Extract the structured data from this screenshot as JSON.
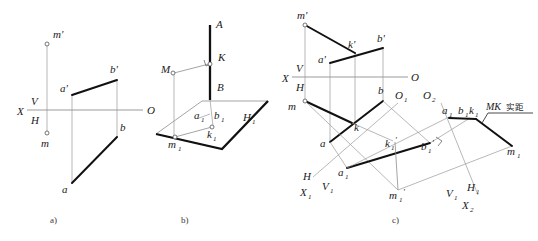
{
  "figure": {
    "width": 538,
    "height": 241,
    "background": "#ffffff",
    "line_color_thick": "#111111",
    "line_color_thin": "#9a9a9a",
    "subfigure_captions": [
      "a)",
      "b)",
      "c)"
    ]
  },
  "panel_a": {
    "caption": "a)",
    "axis_labels": {
      "x": "X",
      "v": "V",
      "h": "H",
      "o": "O"
    },
    "points": [
      {
        "id": "m-prime",
        "label": "m'",
        "x": 47,
        "y": 42
      },
      {
        "id": "a-prime",
        "label": "a'",
        "x": 72,
        "y": 95
      },
      {
        "id": "b-prime",
        "label": "b'",
        "x": 117,
        "y": 80
      },
      {
        "id": "b",
        "label": "b",
        "x": 117,
        "y": 137
      },
      {
        "id": "m",
        "label": "m",
        "x": 47,
        "y": 138
      },
      {
        "id": "a",
        "label": "a",
        "x": 72,
        "y": 183
      }
    ]
  },
  "panel_b": {
    "caption": "b)",
    "labels": {
      "line_top": "A",
      "line_bottom": "B",
      "point_k": "K",
      "point_m": "M",
      "plane": "H1",
      "a1": "a1",
      "b1": "b1",
      "k1": "k1",
      "m1": "m1"
    },
    "points": [
      {
        "id": "K",
        "label": "K",
        "x": 210,
        "y": 63
      },
      {
        "id": "M",
        "label": "M",
        "x": 172,
        "y": 73
      },
      {
        "id": "k1",
        "label": "k1",
        "x": 213,
        "y": 126
      },
      {
        "id": "m1",
        "label": "m1",
        "x": 174,
        "y": 138
      }
    ],
    "right_angle_at": "K"
  },
  "panel_c": {
    "caption": "c)",
    "axis_labels": {
      "x": "X",
      "v": "V",
      "h": "H",
      "o": "O",
      "o1": "O1",
      "o2": "O2",
      "x1": "X1",
      "v1_left": "V1",
      "h_left": "H",
      "x2": "X2",
      "v1_right": "V1",
      "h1_right": "H1"
    },
    "annotation": {
      "text": "MK实距",
      "latin": "MK",
      "cjk": "实距"
    },
    "points": [
      {
        "id": "m-prime",
        "label": "m'",
        "x": 305,
        "y": 22
      },
      {
        "id": "a-prime",
        "label": "a'",
        "x": 330,
        "y": 62
      },
      {
        "id": "k-prime",
        "label": "k'",
        "x": 356,
        "y": 50
      },
      {
        "id": "b-prime",
        "label": "b'",
        "x": 383,
        "y": 47
      },
      {
        "id": "m",
        "label": "m",
        "x": 305,
        "y": 101
      },
      {
        "id": "b",
        "label": "b",
        "x": 383,
        "y": 100
      },
      {
        "id": "k",
        "label": "k",
        "x": 350,
        "y": 122
      },
      {
        "id": "a",
        "label": "a",
        "x": 330,
        "y": 141
      },
      {
        "id": "a1-prime",
        "label": "a1'",
        "x": 347,
        "y": 167
      },
      {
        "id": "k1-prime",
        "label": "k1'",
        "x": 394,
        "y": 140
      },
      {
        "id": "b1-prime",
        "label": "b1'",
        "x": 430,
        "y": 142
      },
      {
        "id": "m1-prime",
        "label": "m1'",
        "x": 398,
        "y": 190
      },
      {
        "id": "a1",
        "label": "a1",
        "x": 449,
        "y": 115
      },
      {
        "id": "b1k1",
        "label": "b1k1",
        "x": 470,
        "y": 116
      },
      {
        "id": "m1",
        "label": "m1",
        "x": 514,
        "y": 145
      }
    ]
  }
}
